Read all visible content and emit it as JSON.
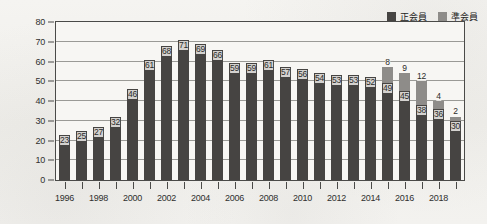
{
  "chart_data": {
    "type": "bar",
    "stacked": true,
    "title": "",
    "subtitle": "",
    "xlabel": "",
    "ylabel": "",
    "ylim": [
      0,
      80
    ],
    "ytick_step": 10,
    "yticks": [
      0,
      10,
      20,
      30,
      40,
      50,
      60,
      70,
      80
    ],
    "grid": true,
    "legend_position": "top-right",
    "categories": [
      "1996",
      "1997",
      "1998",
      "1999",
      "2000",
      "2001",
      "2002",
      "2003",
      "2004",
      "2005",
      "2006",
      "2007",
      "2008",
      "2009",
      "2010",
      "2011",
      "2012",
      "2013",
      "2014",
      "2015",
      "2016",
      "2017",
      "2018",
      "2019"
    ],
    "xtick_labels_shown": [
      "1996",
      "1998",
      "2000",
      "2002",
      "2004",
      "2006",
      "2008",
      "2010",
      "2012",
      "2014",
      "2016",
      "2018"
    ],
    "series": [
      {
        "name": "正会員",
        "color": "#464442",
        "values": [
          23,
          25,
          27,
          32,
          46,
          61,
          68,
          71,
          69,
          66,
          59,
          59,
          61,
          57,
          56,
          54,
          53,
          53,
          52,
          49,
          45,
          38,
          36,
          30
        ],
        "labels": [
          "23",
          "25",
          "27",
          "32",
          "46",
          "61",
          "68",
          "71",
          "69",
          "66",
          "59",
          "59",
          "61",
          "57",
          "56",
          "54",
          "53",
          "53",
          "52",
          "49",
          "45",
          "38",
          "36",
          "30"
        ]
      },
      {
        "name": "準会員",
        "color": "#8e8c89",
        "values": [
          0,
          0,
          0,
          0,
          0,
          0,
          0,
          0,
          0,
          0,
          0,
          0,
          0,
          0,
          0,
          0,
          0,
          0,
          0,
          8,
          9,
          12,
          4,
          2
        ],
        "labels": [
          "",
          "",
          "",
          "",
          "",
          "",
          "",
          "",
          "",
          "",
          "",
          "",
          "",
          "",
          "",
          "",
          "",
          "",
          "",
          "8",
          "9",
          "12",
          "4",
          "2"
        ]
      }
    ]
  },
  "legend": {
    "items": [
      {
        "label": "正会員",
        "color": "#464442"
      },
      {
        "label": "準会員",
        "color": "#8e8c89"
      }
    ]
  }
}
